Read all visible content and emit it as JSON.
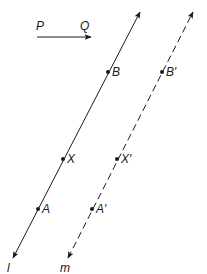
{
  "diagram": {
    "vector": {
      "start_label": "P",
      "end_label": "Q"
    },
    "lines": [
      {
        "id": "l",
        "label": "l",
        "style": "solid"
      },
      {
        "id": "m",
        "label": "m",
        "style": "dashed"
      }
    ],
    "points": [
      {
        "id": "B",
        "label": "B",
        "on": "l"
      },
      {
        "id": "X",
        "label": "X",
        "on": "l"
      },
      {
        "id": "A",
        "label": "A",
        "on": "l"
      },
      {
        "id": "B2",
        "label": "B′",
        "on": "m"
      },
      {
        "id": "X2",
        "label": "X′",
        "on": "m"
      },
      {
        "id": "A2",
        "label": "A′",
        "on": "m"
      }
    ],
    "colors": {
      "ink": "#1a1a1a"
    }
  }
}
